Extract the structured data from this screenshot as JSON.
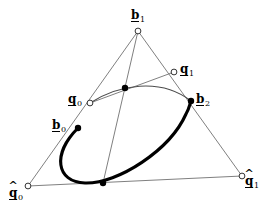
{
  "figure": {
    "colors": {
      "line_gray": "#808080",
      "curve_black": "#000000",
      "marker_fill": "#000000",
      "marker_open": "#ffffff",
      "background": "#ffffff"
    },
    "labels": [
      {
        "id": "b1",
        "base": "b",
        "sub": "1",
        "hat": false,
        "underline": true,
        "x": 131,
        "y": 6,
        "marker": "open",
        "mx": 138,
        "my": 31
      },
      {
        "id": "q1",
        "base": "q",
        "sub": "1",
        "hat": false,
        "underline": true,
        "x": 180,
        "y": 60,
        "marker": "open",
        "mx": 174,
        "my": 72
      },
      {
        "id": "b2",
        "base": "b",
        "sub": "2",
        "hat": false,
        "underline": true,
        "x": 196,
        "y": 90,
        "marker": "filled",
        "mx": 191,
        "my": 101
      },
      {
        "id": "q0",
        "base": "q",
        "sub": "0",
        "hat": false,
        "underline": true,
        "x": 68,
        "y": 90,
        "marker": "open",
        "mx": 90,
        "my": 103
      },
      {
        "id": "b0",
        "base": "b",
        "sub": "0",
        "hat": false,
        "underline": true,
        "x": 52,
        "y": 116,
        "marker": "filled",
        "mx": 78,
        "my": 128
      },
      {
        "id": "qhat0",
        "base": "q",
        "sub": "0",
        "hat": true,
        "underline": true,
        "x": 9,
        "y": 184,
        "marker": "open",
        "mx": 28,
        "my": 186
      },
      {
        "id": "qhat1",
        "base": "q",
        "sub": "1",
        "hat": true,
        "underline": true,
        "x": 245,
        "y": 172,
        "marker": "open",
        "mx": 242,
        "my": 176
      }
    ],
    "unlabeled_points": [
      {
        "id": "midpoint-top",
        "x": 125,
        "y": 88,
        "marker": "filled"
      },
      {
        "id": "midpoint-bottom",
        "x": 103,
        "y": 183,
        "marker": "filled"
      }
    ],
    "paths": {
      "triangle_left": "M 138 31 L 28 186",
      "triangle_right": "M 138 31 L 242 176",
      "triangle_bottom": "M 28 186 L 242 176",
      "cevian": "M 138 31 L 103 183",
      "chord_q0_q1": "M 90 103 L 174 72",
      "thin_conic": "M 90 103 C 118 85 160 77 191 101",
      "thick_ellipse": "M 78 128 C 52 154 56 182 85 183 C 118 184 170 150 186 114 C 189 109 190 104 191 101"
    }
  }
}
